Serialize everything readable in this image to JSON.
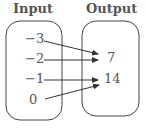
{
  "input": {
    "title": "Input",
    "values": [
      "−3",
      "−2",
      "−1",
      "0"
    ]
  },
  "output": {
    "title": "Output",
    "values": [
      "7",
      "14"
    ]
  },
  "mappings": [
    {
      "from": "−3",
      "to": "7"
    },
    {
      "from": "−2",
      "to": "7"
    },
    {
      "from": "−1",
      "to": "14"
    },
    {
      "from": "0",
      "to": "14"
    }
  ]
}
